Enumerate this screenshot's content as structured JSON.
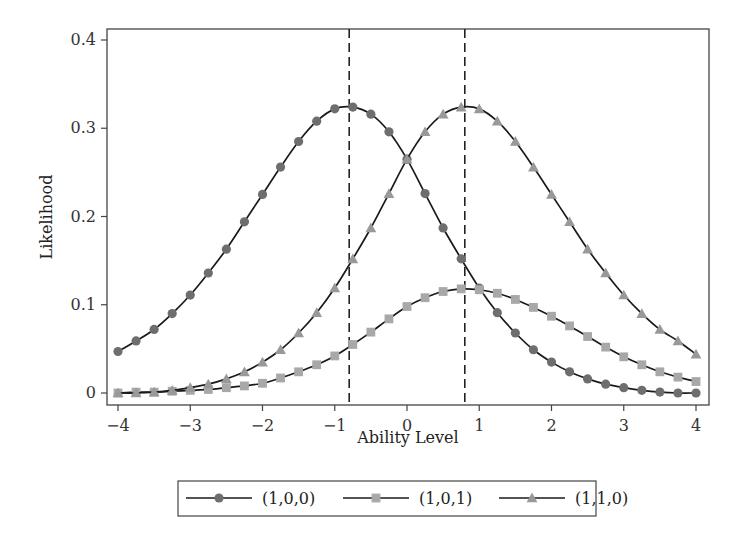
{
  "chart_data": {
    "type": "line",
    "title": "",
    "xlabel": "Ability Level",
    "ylabel": "Likelihood",
    "xlim": [
      -4,
      4
    ],
    "ylim": [
      0,
      0.4
    ],
    "x_ticks": [
      -4,
      -3,
      -2,
      -1,
      0,
      1,
      2,
      3,
      4
    ],
    "x_tick_labels": [
      "−4",
      "−3",
      "−2",
      "−1",
      "0",
      "1",
      "2",
      "3",
      "4"
    ],
    "y_ticks": [
      0,
      0.1,
      0.2,
      0.3,
      0.4
    ],
    "y_tick_labels": [
      "0",
      "0.1",
      "0.2",
      "0.3",
      "0.4"
    ],
    "grid": false,
    "legend_position": "bottom",
    "reference_lines": [
      {
        "orientation": "vertical",
        "x": -0.8,
        "style": "dashed"
      },
      {
        "orientation": "vertical",
        "x": 0.8,
        "style": "dashed"
      }
    ],
    "x": [
      -4,
      -3.75,
      -3.5,
      -3.25,
      -3,
      -2.75,
      -2.5,
      -2.25,
      -2,
      -1.75,
      -1.5,
      -1.25,
      -1,
      -0.75,
      -0.5,
      -0.25,
      0,
      0.25,
      0.5,
      0.75,
      1,
      1.25,
      1.5,
      1.75,
      2,
      2.25,
      2.5,
      2.75,
      3,
      3.25,
      3.5,
      3.75,
      4
    ],
    "series": [
      {
        "name": "(1,0,0)",
        "marker": "circle",
        "color": "#6e6e6e",
        "values": [
          0.047,
          0.059,
          0.072,
          0.09,
          0.111,
          0.136,
          0.163,
          0.194,
          0.225,
          0.256,
          0.285,
          0.308,
          0.322,
          0.324,
          0.316,
          0.296,
          0.265,
          0.226,
          0.187,
          0.152,
          0.119,
          0.091,
          0.068,
          0.049,
          0.035,
          0.024,
          0.016,
          0.01,
          0.006,
          0.003,
          0.001,
          0.0,
          0.0
        ]
      },
      {
        "name": "(1,0,1)",
        "marker": "square",
        "color": "#a8a8a8",
        "values": [
          0.0,
          0.001,
          0.001,
          0.002,
          0.003,
          0.004,
          0.006,
          0.008,
          0.011,
          0.017,
          0.024,
          0.032,
          0.042,
          0.055,
          0.069,
          0.084,
          0.098,
          0.108,
          0.115,
          0.118,
          0.117,
          0.113,
          0.106,
          0.097,
          0.087,
          0.076,
          0.064,
          0.052,
          0.041,
          0.032,
          0.024,
          0.018,
          0.013
        ]
      },
      {
        "name": "(1,1,0)",
        "marker": "triangle",
        "color": "#999999",
        "values": [
          0.0,
          0.0,
          0.001,
          0.003,
          0.006,
          0.01,
          0.016,
          0.024,
          0.035,
          0.049,
          0.068,
          0.091,
          0.119,
          0.152,
          0.187,
          0.226,
          0.265,
          0.296,
          0.316,
          0.324,
          0.322,
          0.308,
          0.285,
          0.256,
          0.225,
          0.194,
          0.163,
          0.136,
          0.111,
          0.09,
          0.072,
          0.059,
          0.044
        ]
      }
    ]
  }
}
